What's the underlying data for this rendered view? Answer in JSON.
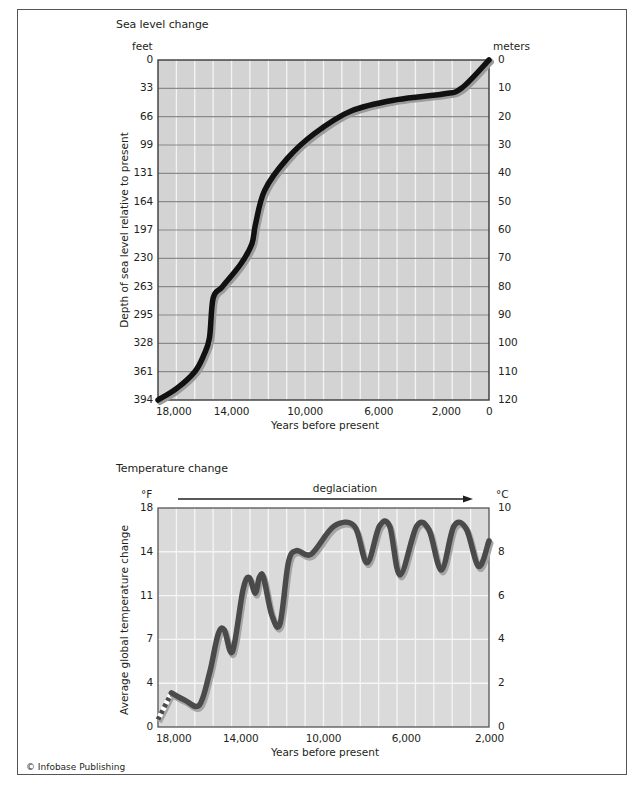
{
  "credit": "© Infobase Publishing",
  "chart_data": [
    {
      "type": "line",
      "title": "Sea level change",
      "xlabel": "Years before present",
      "ylabel": "Depth of sea level relative to present",
      "y_left_unit": "feet",
      "y_right_unit": "meters",
      "x_ticks": [
        "18,000",
        "14,000",
        "10,000",
        "6,000",
        "2,000",
        "0"
      ],
      "y_left_ticks": [
        "0",
        "33",
        "66",
        "99",
        "131",
        "164",
        "197",
        "230",
        "263",
        "295",
        "328",
        "361",
        "394"
      ],
      "y_right_ticks": [
        "0",
        "10",
        "20",
        "30",
        "40",
        "50",
        "60",
        "70",
        "80",
        "90",
        "100",
        "110",
        "120"
      ],
      "xlim": [
        18000,
        0
      ],
      "ylim_meters": [
        120,
        0
      ],
      "ylim_feet": [
        394,
        0
      ],
      "y_inverted": true,
      "grid": true,
      "series": [
        {
          "name": "Sea level depth (m)",
          "x": [
            18000,
            17000,
            16000,
            15500,
            15200,
            15000,
            14500,
            13500,
            12900,
            12700,
            12200,
            11000,
            9500,
            7500,
            5000,
            2500,
            1500,
            0
          ],
          "y": [
            120,
            116,
            110,
            104,
            98,
            84,
            80,
            72,
            65,
            58,
            46,
            35,
            26,
            18,
            14,
            12,
            10,
            0
          ]
        }
      ]
    },
    {
      "type": "line",
      "title": "Temperature change",
      "annotation": "deglaciation",
      "xlabel": "Years before present",
      "ylabel": "Average global temperature change",
      "y_left_unit": "°F",
      "y_right_unit": "°C",
      "x_ticks": [
        "18,000",
        "14,000",
        "10,000",
        "6,000",
        "2,000"
      ],
      "y_left_ticks": [
        "0",
        "4",
        "7",
        "11",
        "14",
        "18"
      ],
      "y_right_ticks": [
        "0",
        "2",
        "4",
        "6",
        "8",
        "10"
      ],
      "xlim": [
        18000,
        2000
      ],
      "ylim_f": [
        0,
        18
      ],
      "ylim_c": [
        0,
        10
      ],
      "grid": true,
      "series": [
        {
          "name": "Temperature change (°F), estimated (dashed)",
          "x": [
            18000,
            17350
          ],
          "y": [
            0.6,
            2.8
          ]
        },
        {
          "name": "Temperature change (°F)",
          "x": [
            17350,
            16700,
            16000,
            15500,
            15100,
            14800,
            14400,
            13900,
            13600,
            13300,
            13100,
            12900,
            12500,
            12100,
            11700,
            11300,
            10600,
            9500,
            8500,
            7900,
            7300,
            6800,
            6300,
            5500,
            4900,
            4300,
            3700,
            3100,
            2500,
            2000
          ],
          "y": [
            2.8,
            2.2,
            1.8,
            4.5,
            7.6,
            8.0,
            6.2,
            11.2,
            12.3,
            11.0,
            12.3,
            12.3,
            9.2,
            8.5,
            13.5,
            14.5,
            14.2,
            16.5,
            16.5,
            13.5,
            16.5,
            16.5,
            12.5,
            16.5,
            16.2,
            12.9,
            16.5,
            16.3,
            13.2,
            15.3
          ]
        }
      ]
    }
  ]
}
